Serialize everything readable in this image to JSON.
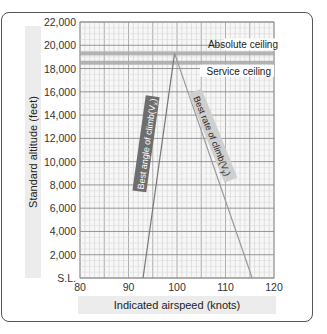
{
  "chart_data": {
    "type": "line",
    "title": "",
    "xlabel": "Indicated airspeed (knots)",
    "ylabel": "Standard altitude (feet)",
    "xlim": [
      80,
      120
    ],
    "ylim": [
      0,
      22000
    ],
    "x_ticks": [
      "80",
      "90",
      "100",
      "110",
      "120"
    ],
    "y_ticks": [
      "S.L.",
      "2,000",
      "4,000",
      "6,000",
      "8,000",
      "10,000",
      "12,000",
      "14,000",
      "16,000",
      "18,000",
      "20,000",
      "22,000"
    ],
    "grid": true,
    "series": [
      {
        "name": "Best angle of climb(Vx)",
        "points": [
          [
            93,
            0
          ],
          [
            99.5,
            19300
          ]
        ],
        "color": "#777777"
      },
      {
        "name": "Best rate of climb(Vy)",
        "points": [
          [
            99.5,
            19300
          ],
          [
            115.5,
            0
          ]
        ],
        "color": "#aaaaaa"
      }
    ],
    "reference_lines": [
      {
        "name": "Absolute ceiling",
        "y": 19300
      },
      {
        "name": "Service ceiling",
        "y": 18500
      }
    ]
  },
  "labels": {
    "absolute_ceiling": "Absolute ceiling",
    "service_ceiling": "Service ceiling",
    "vx_label": "Best angle of climb(V",
    "vx_sub": "x",
    "vy_label": "Best rate of climb(V",
    "vy_sub": "y",
    "close_paren": ")"
  }
}
